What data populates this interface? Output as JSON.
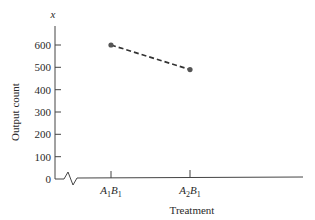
{
  "chart_data": {
    "type": "line",
    "title": "",
    "xlabel": "Treatment",
    "ylabel": "Output count",
    "y_axis_symbol": "x",
    "categories": [
      "A1B1",
      "A2B1"
    ],
    "category_labels": [
      {
        "main1": "A",
        "sub1": "1",
        "main2": "B",
        "sub2": "1"
      },
      {
        "main1": "A",
        "sub1": "2",
        "main2": "B",
        "sub2": "1"
      }
    ],
    "series": [
      {
        "name": "Output count",
        "values": [
          600,
          490
        ],
        "line_style": "dashed",
        "marker": "circle",
        "color": "#555555"
      }
    ],
    "ylim": [
      0,
      600
    ],
    "yticks": [
      0,
      100,
      200,
      300,
      400,
      500,
      600
    ],
    "ytick_labels": [
      "0",
      "100",
      "200",
      "300",
      "400",
      "500",
      "600"
    ],
    "axis_break": true,
    "grid": false,
    "legend": false
  }
}
